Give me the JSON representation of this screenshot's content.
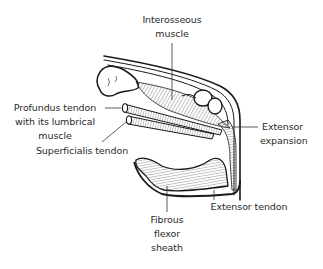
{
  "diagram": {
    "labels": {
      "interosseous": [
        "Interosseous",
        "muscle"
      ],
      "profundus": [
        "Profundus tendon",
        "with its lumbrical",
        "muscle"
      ],
      "superficialis": [
        "Superficialis tendon"
      ],
      "extensor_expansion": [
        "Extensor",
        "expansion"
      ],
      "extensor_tendon": [
        "Extensor tendon"
      ],
      "fibrous_sheath": [
        "Fibrous",
        "flexor",
        "sheath"
      ]
    },
    "colors": {
      "ink": "#1a1a1a",
      "text": "#2a2a2a",
      "background": "#ffffff"
    }
  }
}
